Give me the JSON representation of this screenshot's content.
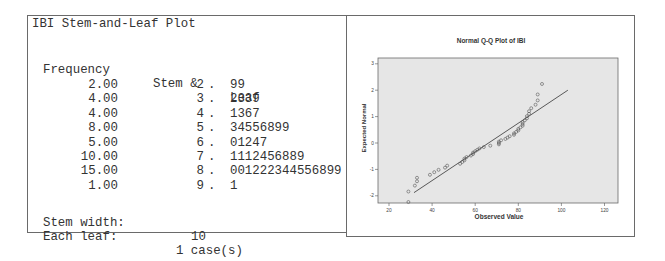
{
  "stem_leaf": {
    "title": "IBI Stem-and-Leaf Plot",
    "headers": {
      "frequency": "Frequency",
      "stem": "Stem &",
      "leaf": "Leaf"
    },
    "rows": [
      {
        "frequency": "2.00",
        "stem": "2",
        "dot": ".",
        "leaf": "99"
      },
      {
        "frequency": "4.00",
        "stem": "3",
        "dot": ".",
        "leaf": "2339"
      },
      {
        "frequency": "4.00",
        "stem": "4",
        "dot": ".",
        "leaf": "1367"
      },
      {
        "frequency": "8.00",
        "stem": "5",
        "dot": ".",
        "leaf": "34556899"
      },
      {
        "frequency": "5.00",
        "stem": "6",
        "dot": ".",
        "leaf": "01247"
      },
      {
        "frequency": "10.00",
        "stem": "7",
        "dot": ".",
        "leaf": "1112456889"
      },
      {
        "frequency": "15.00",
        "stem": "8",
        "dot": ".",
        "leaf": "001222344556899"
      },
      {
        "frequency": "1.00",
        "stem": "9",
        "dot": ".",
        "leaf": "1"
      }
    ],
    "stem_width_label": "Stem width:",
    "stem_width_value": "10",
    "each_leaf_label": "Each leaf:",
    "each_leaf_value": "1 case(s)"
  },
  "chart_data": {
    "type": "scatter",
    "title": "Normal Q-Q Plot of IBI",
    "xlabel": "Observed Value",
    "ylabel": "Expected Normal",
    "xlim": [
      15,
      125
    ],
    "ylim": [
      -2.3,
      3.2
    ],
    "xticks": [
      20,
      40,
      60,
      80,
      100,
      120
    ],
    "yticks": [
      -2,
      -1,
      0,
      1,
      2,
      3
    ],
    "grid": false,
    "legend": null,
    "observed_values": [
      29,
      29,
      32,
      33,
      33,
      39,
      41,
      43,
      46,
      47,
      53,
      54,
      55,
      55,
      56,
      58,
      59,
      59,
      60,
      61,
      62,
      64,
      67,
      71,
      71,
      71,
      72,
      74,
      75,
      76,
      78,
      78,
      79,
      80,
      80,
      81,
      82,
      82,
      82,
      83,
      84,
      84,
      85,
      85,
      86,
      88,
      89,
      89,
      91
    ],
    "reference_line": {
      "x": [
        31.6,
        103
      ],
      "y": [
        -1.88,
        2.0
      ]
    },
    "colors": {
      "plot_bg": "#e6e6e6",
      "marker": "#555555",
      "line": "#333333",
      "frame": "#6a6a6a"
    }
  }
}
